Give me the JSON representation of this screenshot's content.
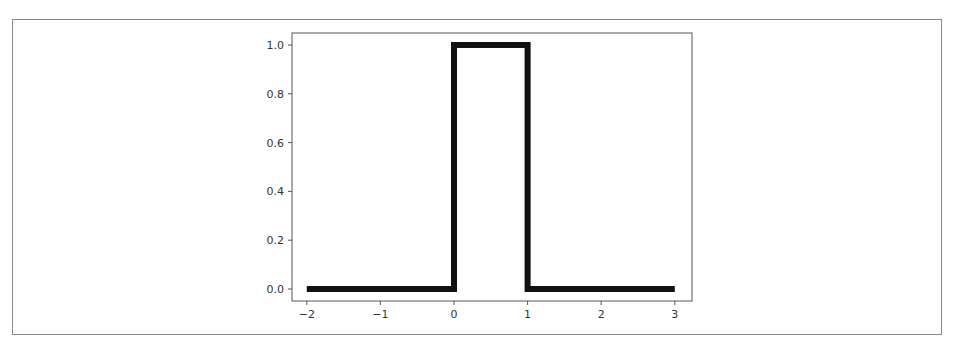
{
  "chart_data": {
    "type": "line",
    "title": "",
    "xlabel": "",
    "ylabel": "",
    "x": [
      -2,
      0,
      0,
      1,
      1,
      3
    ],
    "series": [
      {
        "name": "rectangular pulse",
        "values": [
          0,
          0,
          1,
          1,
          0,
          0
        ],
        "color": "#111111"
      }
    ],
    "xlim": [
      -2.2,
      3.25
    ],
    "ylim": [
      -0.05,
      1.05
    ],
    "xticks": [
      -2,
      -1,
      0,
      1,
      2,
      3
    ],
    "xtick_labels": [
      "−2",
      "−1",
      "0",
      "1",
      "2",
      "3"
    ],
    "yticks": [
      0.0,
      0.2,
      0.4,
      0.6,
      0.8,
      1.0
    ],
    "ytick_labels": [
      "0.0",
      "0.2",
      "0.4",
      "0.6",
      "0.8",
      "1.0"
    ],
    "grid": false,
    "legend": null
  }
}
